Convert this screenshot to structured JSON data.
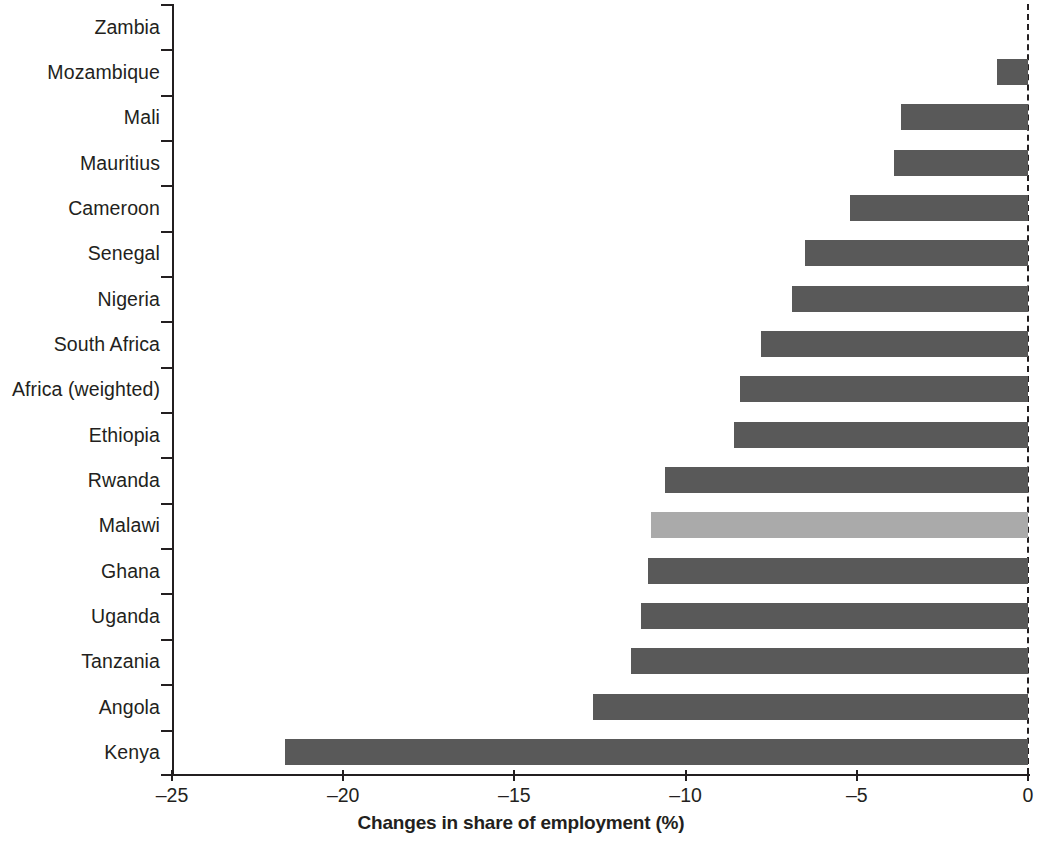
{
  "chart_data": {
    "type": "bar",
    "orientation": "horizontal",
    "title": "",
    "subtitle": "",
    "xlabel": "Changes in share of employment (%)",
    "ylabel": "",
    "xlim": [
      -25,
      0
    ],
    "xticks": [
      -25,
      -20,
      -15,
      -10,
      -5,
      0
    ],
    "xtick_labels": [
      "–25",
      "–20",
      "–15",
      "–10",
      "–5",
      "0"
    ],
    "grid": false,
    "legend": null,
    "bar_color": "#595959",
    "highlight_color": "#aaaaaa",
    "highlight_category": "Malawi",
    "categories": [
      "Zambia",
      "Mozambique",
      "Mali",
      "Mauritius",
      "Cameroon",
      "Senegal",
      "Nigeria",
      "South Africa",
      "Africa (weighted)",
      "Ethiopia",
      "Rwanda",
      "Malawi",
      "Ghana",
      "Uganda",
      "Tanzania",
      "Angola",
      "Kenya"
    ],
    "values": [
      0.0,
      -0.9,
      -3.7,
      -3.9,
      -5.2,
      -6.5,
      -6.9,
      -7.8,
      -8.4,
      -8.6,
      -10.6,
      -11.0,
      -11.1,
      -11.3,
      -11.6,
      -12.7,
      -21.7
    ],
    "highlighted": [
      false,
      false,
      false,
      false,
      false,
      false,
      false,
      false,
      false,
      false,
      false,
      true,
      false,
      false,
      false,
      false,
      false
    ]
  }
}
